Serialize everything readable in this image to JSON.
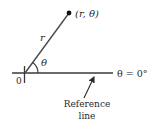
{
  "diagram": {
    "point_label": "(r, θ)",
    "radius_label": "r",
    "angle_label": "θ",
    "origin_label": "0",
    "reference_equation": "θ = 0°",
    "reference_caption_line1": "Reference",
    "reference_caption_line2": "line",
    "colors": {
      "line": "#3a3a3a",
      "text": "#2a2a2a",
      "background": "#ffffff"
    }
  }
}
